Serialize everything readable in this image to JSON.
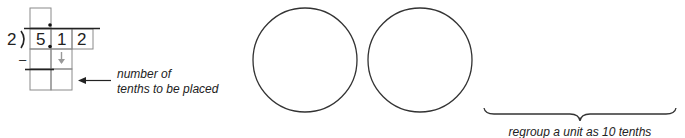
{
  "division": {
    "divisor": "2",
    "dividend_digits": [
      "5",
      "1",
      "2"
    ],
    "subtract_sign": "–",
    "bring_down_arrow": "↓"
  },
  "annotations": {
    "tenths_label_line1": "number of",
    "tenths_label_line2": "tenths to be placed",
    "regroup_label": "regroup a unit as 10 tenths"
  },
  "circles": [
    {
      "cx": 305,
      "cy": 60,
      "r": 52
    },
    {
      "cx": 420,
      "cy": 60,
      "r": 52
    }
  ],
  "colors": {
    "stroke": "#333333",
    "arrow_gray": "#999999",
    "text": "#222222"
  }
}
